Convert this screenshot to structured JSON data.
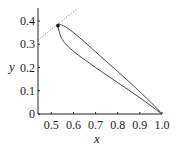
{
  "chart_data": {
    "type": "line",
    "title": "",
    "xlabel": "x",
    "ylabel": "y",
    "xlim": [
      0.44,
      1.0
    ],
    "ylim": [
      0,
      0.456
    ],
    "xticks": [
      0.5,
      0.6,
      0.7,
      0.8,
      0.9,
      1.0
    ],
    "xtick_labels": [
      "0.5",
      "0.6",
      "0.7",
      "0.8",
      "0.9",
      "1.0"
    ],
    "yticks": [
      0,
      0.1,
      0.2,
      0.3,
      0.4
    ],
    "ytick_labels": [
      "0",
      "0.1",
      "0.2",
      "0.3",
      "0.4"
    ],
    "grid": false,
    "legend": null,
    "series": [
      {
        "name": "closed loop curve",
        "style": "solid",
        "color": "#333333",
        "x": [
          1.0,
          0.9,
          0.8,
          0.7,
          0.6,
          0.55,
          0.53,
          0.54,
          0.58,
          0.65,
          0.75,
          0.85,
          0.95,
          1.0
        ],
        "y": [
          0.0,
          0.07,
          0.135,
          0.2,
          0.27,
          0.32,
          0.38,
          0.385,
          0.365,
          0.31,
          0.225,
          0.14,
          0.05,
          0.0
        ]
      },
      {
        "name": "dotted reference line",
        "style": "dotted",
        "color": "#888888",
        "x": [
          0.44,
          0.62
        ],
        "y": [
          0.318,
          0.456
        ]
      }
    ],
    "points": [
      {
        "name": "marked point",
        "x": 0.53,
        "y": 0.38,
        "color": "#111111"
      }
    ]
  }
}
